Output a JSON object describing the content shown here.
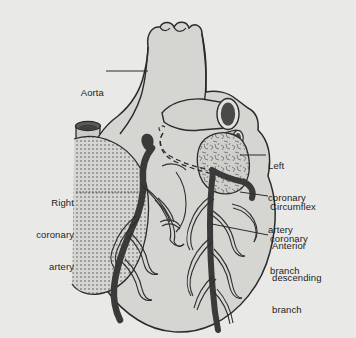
{
  "figure": {
    "style": "line-art-diagram",
    "background_color": "#e9e9e7",
    "heart_fill_color": "#d5d5d2",
    "outline_color": "#2b2b2b",
    "artery_color": "#3a3a3a",
    "text_color": "#1d1d1d",
    "vessel_lumen_color": "#4a4a4a"
  },
  "labels": {
    "aorta": {
      "line1": "Aorta",
      "full_text": "Aorta",
      "side": "left",
      "points_to": "ascending-aorta"
    },
    "right_coronary_artery": {
      "line1": "Right",
      "line2": "coronary",
      "line3": "artery",
      "full_text": "Right coronary artery",
      "side": "left",
      "points_to": "right-coronary-artery"
    },
    "left_coronary_artery": {
      "line1": "Left",
      "line2": "coronary",
      "line3": "artery",
      "full_text": "Left coronary artery",
      "side": "right",
      "points_to": "left-coronary-artery"
    },
    "circumflex_coronary_branch": {
      "line1": "Circumflex",
      "line2": "coronary",
      "line3": "branch",
      "full_text": "Circumflex coronary branch",
      "side": "right",
      "points_to": "circumflex-branch"
    },
    "anterior_descending_branch": {
      "line1": "Anterior",
      "line2": "descending",
      "line3": "branch",
      "full_text": "Anterior descending branch",
      "side": "right",
      "points_to": "anterior-descending-branch"
    }
  },
  "anatomy": {
    "structures": [
      "aortic-arch",
      "ascending-aorta",
      "superior-vena-cava",
      "pulmonary-trunk",
      "right-atrial-appendage",
      "left-atrial-appendage",
      "right-ventricle",
      "left-ventricle",
      "right-coronary-artery",
      "left-coronary-artery",
      "circumflex-coronary-branch",
      "anterior-descending-branch"
    ]
  }
}
